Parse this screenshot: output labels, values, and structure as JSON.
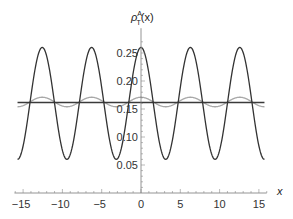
{
  "chart_data": {
    "type": "line",
    "title": "",
    "xlabel": "x",
    "ylabel": "ρ_T^A(x)",
    "ylabel_parts": {
      "base": "ρ",
      "sup": "A",
      "sub": "T",
      "arg": "(x)"
    },
    "xlim": [
      -16.1,
      16.0
    ],
    "ylim": [
      0.0,
      0.28
    ],
    "grid": false,
    "legend": null,
    "x_ticks": [
      -15,
      -10,
      -5,
      0,
      5,
      10,
      15
    ],
    "x_tick_labels": [
      "−15",
      "−10",
      "−5",
      "0",
      "5",
      "10",
      "15"
    ],
    "y_ticks": [
      0.05,
      0.1,
      0.15,
      0.2,
      0.25
    ],
    "y_tick_labels": [
      "0.05",
      "0.10",
      "0.15",
      "0.20",
      "0.25"
    ],
    "x_domain": [
      -15.708,
      15.708
    ],
    "series": [
      {
        "name": "dark oscillation",
        "color": "#333333",
        "width": 1.3,
        "formula": "0.16 + 0.1*cos(x)",
        "offset": 0.16,
        "amplitude": 0.1,
        "period": 6.283,
        "x": [
          -15.708,
          -12.566,
          -9.425,
          -6.283,
          -3.142,
          0,
          3.142,
          6.283,
          9.425,
          12.566,
          15.708
        ],
        "values": [
          0.06,
          0.26,
          0.06,
          0.26,
          0.06,
          0.26,
          0.06,
          0.26,
          0.06,
          0.26,
          0.06
        ]
      },
      {
        "name": "light oscillation",
        "color": "#a8a8a8",
        "width": 1.3,
        "formula": "0.1625 + 0.0085*cos(x)",
        "offset": 0.1625,
        "amplitude": 0.0085,
        "period": 6.283,
        "x": [
          -15.708,
          -12.566,
          -9.425,
          -6.283,
          -3.142,
          0,
          3.142,
          6.283,
          9.425,
          12.566,
          15.708
        ],
        "values": [
          0.154,
          0.171,
          0.154,
          0.171,
          0.154,
          0.171,
          0.154,
          0.171,
          0.154,
          0.171,
          0.154
        ]
      },
      {
        "name": "constant",
        "color": "#3a3a3a",
        "width": 1.6,
        "formula": "0.1615",
        "offset": 0.1615,
        "amplitude": 0,
        "period": 6.283,
        "x": [
          -15.708,
          15.708
        ],
        "values": [
          0.1615,
          0.1615
        ]
      }
    ]
  },
  "layout": {
    "origin_px": [
      141,
      193
    ],
    "px_per_x": 7.86,
    "px_per_y": 560
  }
}
